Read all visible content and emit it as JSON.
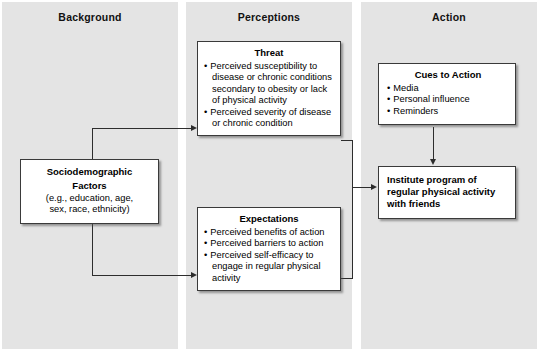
{
  "columns": [
    {
      "id": "background",
      "title": "Background"
    },
    {
      "id": "perceptions",
      "title": "Perceptions"
    },
    {
      "id": "action",
      "title": "Action"
    }
  ],
  "boxes": {
    "sociodemographic": {
      "title_line1": "Sociodemographic",
      "title_line2": "Factors",
      "detail_line1": "(e.g., education, age,",
      "detail_line2": "sex, race, ethnicity)"
    },
    "threat": {
      "title": "Threat",
      "bullets": [
        "Perceived susceptibility to disease or chronic conditions secondary to obesity or lack of physical activity",
        "Perceived severity of disease or chronic condition"
      ]
    },
    "expectations": {
      "title": "Expectations",
      "bullets": [
        "Perceived benefits of action",
        "Perceived barriers to action",
        "Perceived self-efficacy to engage in regular physical activity"
      ]
    },
    "cues_to_action": {
      "title": "Cues to Action",
      "bullets": [
        "Media",
        "Personal influence",
        "Reminders"
      ]
    },
    "institute": {
      "line1": "Institute program of",
      "line2": "regular physical activity",
      "line3": "with friends"
    }
  },
  "colors": {
    "panel_background": "#e4e4e4",
    "box_fill": "#ffffff",
    "box_border": "#3a3a3a",
    "connector": "#2d2d2d",
    "text": "#000000"
  }
}
